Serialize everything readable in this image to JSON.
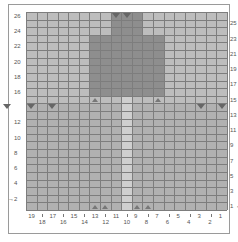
{
  "chart": {
    "title": "",
    "columns": 19,
    "rows": 26,
    "left_row_labels": [
      "26",
      "24",
      "22",
      "20",
      "18",
      "16",
      "12",
      "10",
      "8",
      "6",
      "4",
      "2"
    ],
    "right_row_labels": [
      "25",
      "23",
      "21",
      "19",
      "17",
      "15",
      "13",
      "11",
      "9",
      "7",
      "5",
      "3",
      "1"
    ],
    "bottom_col_labels_upper": [
      "19",
      "17",
      "15",
      "13",
      "11",
      "9",
      "7",
      "5",
      "3",
      "1"
    ],
    "bottom_col_labels_lower": [
      "18",
      "16",
      "14",
      "12",
      "10",
      "8",
      "6",
      "4",
      "2"
    ],
    "start_arrow_right_row": "1",
    "start_arrow_left_row": "2",
    "colors": {
      "background": "#bdbdbd",
      "dark_block": "#8e8e8e",
      "mid_block": "#a8a8a8",
      "light_stripe": "#cfcfcf",
      "grid_line": "#7d7d7d"
    }
  },
  "chart_data": {
    "type": "heatmap",
    "title": "",
    "xlabel": "Stitch",
    "ylabel": "Row",
    "x": [
      19,
      18,
      17,
      16,
      15,
      14,
      13,
      12,
      11,
      10,
      9,
      8,
      7,
      6,
      5,
      4,
      3,
      2,
      1
    ],
    "y_range": [
      1,
      26
    ],
    "regions": [
      {
        "name": "upper-dark-panel",
        "cols": [
          13,
          7
        ],
        "rows": [
          16,
          23
        ],
        "shade": "dark"
      },
      {
        "name": "top-neck",
        "cols": [
          11,
          9
        ],
        "rows": [
          24,
          26
        ],
        "shade": "dark"
      },
      {
        "name": "center-stripe",
        "cols": [
          10,
          10
        ],
        "rows": [
          1,
          15
        ],
        "shade": "light"
      },
      {
        "name": "lower-mid-panel",
        "cols": [
          19,
          1
        ],
        "rows": [
          1,
          14
        ],
        "shade": "mid"
      }
    ],
    "markers": [
      {
        "type": "decrease",
        "row": 26,
        "cols": [
          11,
          10
        ]
      },
      {
        "type": "decrease",
        "row": 14,
        "cols": [
          19,
          17,
          3,
          1
        ]
      },
      {
        "type": "increase",
        "row": 15,
        "cols": [
          13,
          7
        ]
      },
      {
        "type": "increase",
        "row": 1,
        "cols": [
          13,
          12,
          9,
          8
        ]
      }
    ]
  }
}
